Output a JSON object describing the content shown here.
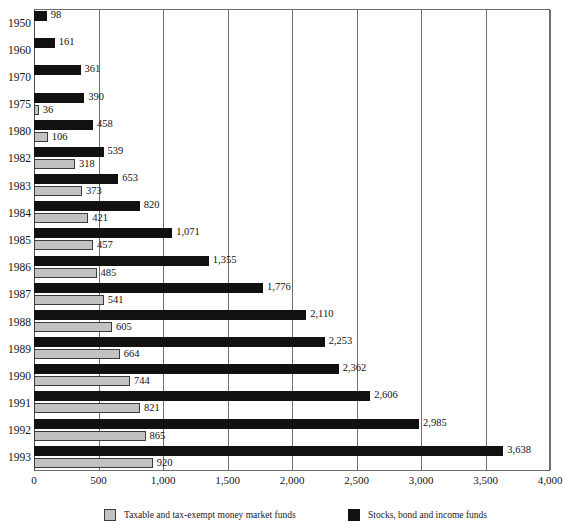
{
  "chart_data": {
    "type": "bar",
    "orientation": "horizontal",
    "title": "",
    "xlabel": "",
    "ylabel": "",
    "xlim": [
      0,
      4000
    ],
    "xticks": [
      "0",
      "500",
      "1,000",
      "1,500",
      "2,000",
      "2,500",
      "3,000",
      "3,500",
      "4,000"
    ],
    "xtick_values": [
      0,
      500,
      1000,
      1500,
      2000,
      2500,
      3000,
      3500,
      4000
    ],
    "grid": "vertical",
    "legend_position": "bottom",
    "categories": [
      "1950",
      "1960",
      "1970",
      "1975",
      "1980",
      "1982",
      "1983",
      "1984",
      "1985",
      "1986",
      "1987",
      "1988",
      "1989",
      "1990",
      "1991",
      "1992",
      "1993"
    ],
    "series": [
      {
        "name": "Stocks, bond and income funds",
        "color": "#111111",
        "values": [
          98,
          161,
          361,
          390,
          458,
          539,
          653,
          820,
          1071,
          1355,
          1776,
          2110,
          2253,
          2362,
          2606,
          2985,
          3638
        ],
        "labels": [
          "98",
          "161",
          "361",
          "390",
          "458",
          "539",
          "653",
          "820",
          "1,071",
          "1,355",
          "1,776",
          "2,110",
          "2,253",
          "2,362",
          "2,606",
          "2,985",
          "3,638"
        ]
      },
      {
        "name": "Taxable and tax-exempt money market funds",
        "color": "#c2c2c2",
        "values": [
          null,
          null,
          null,
          36,
          106,
          318,
          373,
          421,
          457,
          485,
          541,
          605,
          664,
          744,
          821,
          865,
          920
        ],
        "labels": [
          "",
          "",
          "",
          "36",
          "106",
          "318",
          "373",
          "421",
          "457",
          "485",
          "541",
          "605",
          "664",
          "744",
          "821",
          "865",
          "920"
        ]
      }
    ]
  },
  "legend": {
    "money_market_label": "Taxable and tax-exempt money market funds",
    "stocks_label": "Stocks, bond and income funds"
  },
  "title_sliver": ""
}
